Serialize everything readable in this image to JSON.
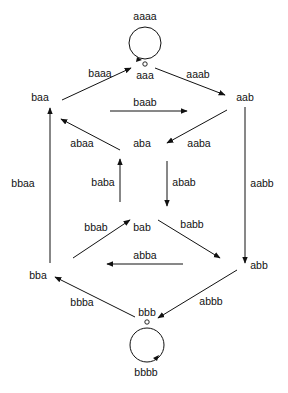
{
  "diagram": {
    "type": "de Bruijn graph",
    "nodes": [
      {
        "id": "aaa",
        "label": "aaa",
        "x": 145,
        "y": 78
      },
      {
        "id": "aab",
        "label": "aab",
        "x": 245,
        "y": 100
      },
      {
        "id": "baa",
        "label": "baa",
        "x": 40,
        "y": 101
      },
      {
        "id": "aba",
        "label": "aba",
        "x": 142,
        "y": 147
      },
      {
        "id": "bab",
        "label": "bab",
        "x": 142,
        "y": 231
      },
      {
        "id": "abb",
        "label": "abb",
        "x": 259,
        "y": 269
      },
      {
        "id": "bba",
        "label": "bba",
        "x": 38,
        "y": 279
      },
      {
        "id": "bbb",
        "label": "bbb",
        "x": 147,
        "y": 316
      }
    ],
    "edges": [
      {
        "label": "aaaa",
        "from": "aaa",
        "to": "aaa",
        "loop": true
      },
      {
        "label": "aaab",
        "from": "aaa",
        "to": "aab"
      },
      {
        "label": "baaa",
        "from": "baa",
        "to": "aaa"
      },
      {
        "label": "baab",
        "from": "baa",
        "to": "aab"
      },
      {
        "label": "aaba",
        "from": "aab",
        "to": "aba"
      },
      {
        "label": "aabb",
        "from": "aab",
        "to": "abb"
      },
      {
        "label": "abaa",
        "from": "aba",
        "to": "baa"
      },
      {
        "label": "abab",
        "from": "aba",
        "to": "bab"
      },
      {
        "label": "baba",
        "from": "bab",
        "to": "aba"
      },
      {
        "label": "babb",
        "from": "bab",
        "to": "abb"
      },
      {
        "label": "bbaa",
        "from": "bba",
        "to": "baa"
      },
      {
        "label": "bbab",
        "from": "bba",
        "to": "bab"
      },
      {
        "label": "abba",
        "from": "abb",
        "to": "bba"
      },
      {
        "label": "abbb",
        "from": "abb",
        "to": "bbb"
      },
      {
        "label": "bbba",
        "from": "bbb",
        "to": "bba"
      },
      {
        "label": "bbbb",
        "from": "bbb",
        "to": "bbb",
        "loop": true
      }
    ]
  }
}
